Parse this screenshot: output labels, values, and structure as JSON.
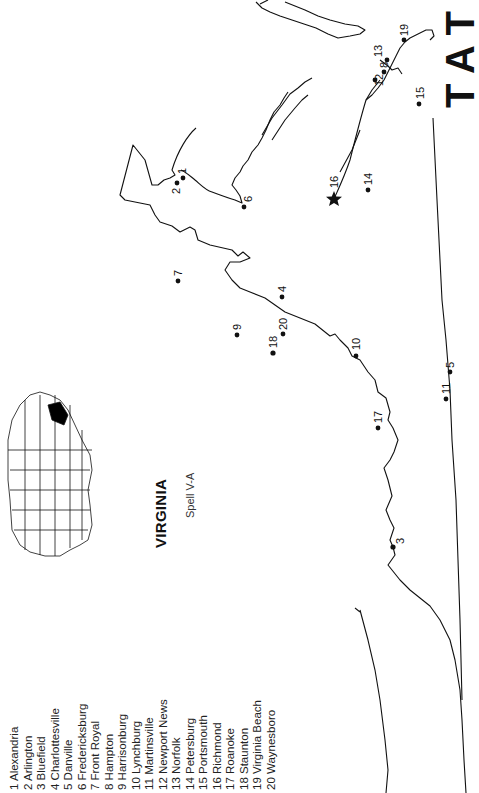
{
  "header": {
    "title_fragment": "T A T O M"
  },
  "map": {
    "title": "VIRGINIA",
    "subtitle": "Spell V-A",
    "inset": {
      "description": "US outline map with Virginia highlighted",
      "highlight_color": "#000000"
    },
    "capital_marker": "star",
    "cities": [
      {
        "num": "1",
        "name": "Alexandria",
        "x": 183,
        "y": 178
      },
      {
        "num": "2",
        "name": "Arlington",
        "x": 177,
        "y": 183
      },
      {
        "num": "3",
        "name": "Bluefield",
        "x": 393,
        "y": 547
      },
      {
        "num": "4",
        "name": "Charlottesville",
        "x": 282,
        "y": 297
      },
      {
        "num": "5",
        "name": "Danville",
        "x": 450,
        "y": 372
      },
      {
        "num": "6",
        "name": "Fredericksburg",
        "x": 244,
        "y": 207
      },
      {
        "num": "7",
        "name": "Front Royal",
        "x": 178,
        "y": 281
      },
      {
        "num": "8",
        "name": "Hampton",
        "x": 384,
        "y": 72
      },
      {
        "num": "9",
        "name": "Harrisonburg",
        "x": 237,
        "y": 335
      },
      {
        "num": "10",
        "name": "Lynchburg",
        "x": 356,
        "y": 356
      },
      {
        "num": "11",
        "name": "Martinsville",
        "x": 446,
        "y": 399
      },
      {
        "num": "12",
        "name": "Newport News",
        "x": 375,
        "y": 80
      },
      {
        "num": "13",
        "name": "Norfolk",
        "x": 387,
        "y": 60
      },
      {
        "num": "14",
        "name": "Petersburg",
        "x": 368,
        "y": 190
      },
      {
        "num": "15",
        "name": "Portsmouth",
        "x": 419,
        "y": 104
      },
      {
        "num": "16",
        "name": "Richmond",
        "x": 334,
        "y": 199
      },
      {
        "num": "17",
        "name": "Roanoke",
        "x": 378,
        "y": 428
      },
      {
        "num": "18",
        "name": "Staunton",
        "x": 273,
        "y": 353
      },
      {
        "num": "19",
        "name": "Virginia Beach",
        "x": 404,
        "y": 40
      },
      {
        "num": "20",
        "name": "Waynesboro",
        "x": 283,
        "y": 334
      }
    ]
  },
  "legend": {
    "items": [
      "1 Alexandria",
      "2 Arlington",
      "3 Bluefield",
      "4 Charlottesville",
      "5 Danville",
      "6 Fredericksburg",
      "7 Front Royal",
      "8 Hampton",
      "9 Harrisonburg",
      "10 Lynchburg",
      "11 Martinsville",
      "12 Newport News",
      "13 Norfolk",
      "14 Petersburg",
      "15 Portsmouth",
      "16 Richmond",
      "17 Roanoke",
      "18 Staunton",
      "19 Virginia Beach",
      "20 Waynesboro"
    ]
  }
}
